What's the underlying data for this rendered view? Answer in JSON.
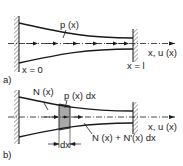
{
  "figure_a": {
    "part_label": "a)",
    "load_label": "p (x)",
    "axis_label": "x, u (x)",
    "start_label": "x = 0",
    "end_label": "x = l"
  },
  "figure_b": {
    "part_label": "b)",
    "force_left_label": "N (x)",
    "load_label": "p (x) dx",
    "force_right_label": "N (x) + N'(x) dx",
    "axis_label": "x, u (x)",
    "width_label": "dx"
  },
  "colors": {
    "line": "#1a1a1a",
    "element_fill": "#a8a8a8",
    "hatch": "#555555"
  }
}
